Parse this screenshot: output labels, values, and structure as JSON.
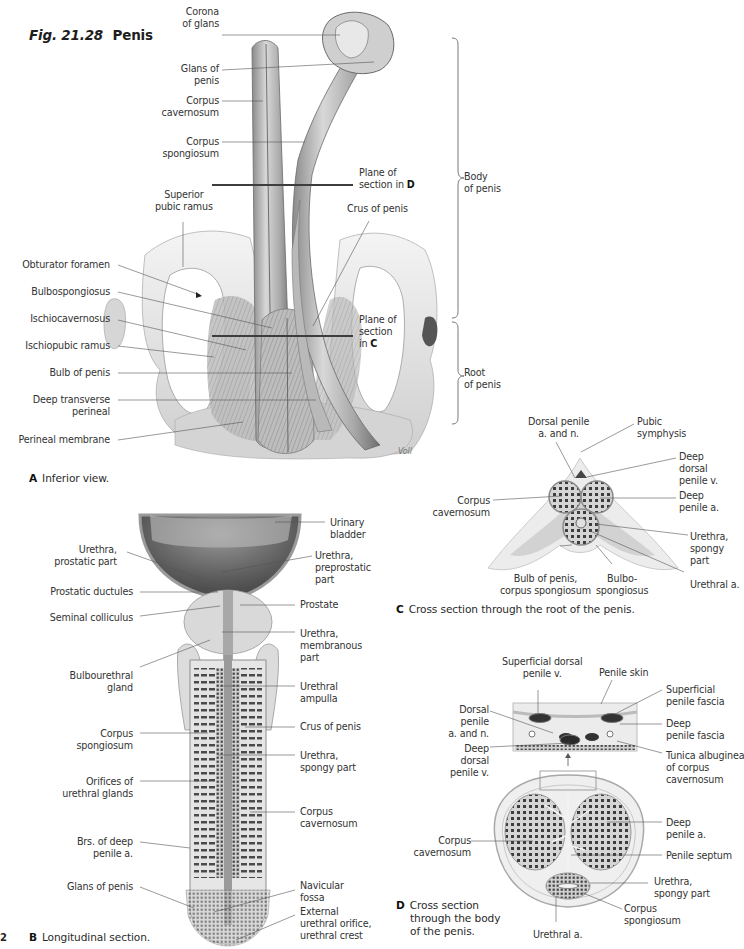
{
  "figure": {
    "number": "Fig. 21.28",
    "title": "Penis",
    "page_number": "2"
  },
  "panel_a": {
    "letter": "A",
    "caption": "Inferior view.",
    "labels": {
      "corona_of_glans": [
        "Corona",
        "of glans"
      ],
      "glans_of_penis": [
        "Glans of",
        "penis"
      ],
      "corpus_cavernosum": [
        "Corpus",
        "cavernosum"
      ],
      "corpus_spongiosum": [
        "Corpus",
        "spongiosum"
      ],
      "plane_of_section_d": [
        "Plane of",
        "section in",
        "D"
      ],
      "superior_pubic_ramus": [
        "Superior",
        "pubic ramus"
      ],
      "crus_of_penis": "Crus of penis",
      "obturator_foramen": "Obturator foramen",
      "bulbospongiosus": "Bulbospongiosus",
      "ischiocavernosus": "Ischiocavernosus",
      "ischiopubic_ramus": "Ischiopubic ramus",
      "bulb_of_penis": "Bulb of penis",
      "deep_transverse_perineal": [
        "Deep transverse",
        "perineal"
      ],
      "perineal_membrane": "Perineal membrane",
      "plane_of_section_c": [
        "Plane of",
        "section",
        "in",
        "C"
      ],
      "body_of_penis": [
        "Body",
        "of penis"
      ],
      "root_of_penis": [
        "Root",
        "of penis"
      ]
    },
    "signature": "Voll"
  },
  "panel_b": {
    "letter": "B",
    "caption": "Longitudinal section.",
    "labels": {
      "urinary_bladder": [
        "Urinary",
        "bladder"
      ],
      "urethra_prostatic_part": [
        "Urethra,",
        "prostatic part"
      ],
      "urethra_preprostatic_part": [
        "Urethra,",
        "preprostatic",
        "part"
      ],
      "prostatic_ductules": "Prostatic ductules",
      "prostate": "Prostate",
      "seminal_colliculus": "Seminal colliculus",
      "urethra_membranous_part": [
        "Urethra,",
        "membranous",
        "part"
      ],
      "bulbourethral_gland": [
        "Bulbourethral",
        "gland"
      ],
      "urethral_ampulla": [
        "Urethral",
        "ampulla"
      ],
      "corpus_spongiosum": [
        "Corpus",
        "spongiosum"
      ],
      "crus_of_penis": "Crus of penis",
      "urethra_spongy_part": [
        "Urethra,",
        "spongy part"
      ],
      "orifices_of_urethral_glands": [
        "Orifices of",
        "urethral glands"
      ],
      "corpus_cavernosum": [
        "Corpus",
        "cavernosum"
      ],
      "brs_of_deep_penile_a": [
        "Brs. of deep",
        "penile a."
      ],
      "glans_of_penis": "Glans of penis",
      "navicular_fossa": [
        "Navicular",
        "fossa"
      ],
      "external_urethral_orifice": [
        "External",
        "urethral orifice,",
        "urethral crest"
      ]
    }
  },
  "panel_c": {
    "letter": "C",
    "caption": "Cross section through the root of the penis.",
    "labels": {
      "dorsal_penile_a_and_n": [
        "Dorsal penile",
        "a. and n."
      ],
      "pubic_symphysis": [
        "Pubic",
        "symphysis"
      ],
      "deep_dorsal_penile_v": [
        "Deep",
        "dorsal",
        "penile v."
      ],
      "corpus_cavernosum": [
        "Corpus",
        "cavernosum"
      ],
      "deep_penile_a": [
        "Deep",
        "penile a."
      ],
      "urethra_spongy_part": [
        "Urethra,",
        "spongy",
        "part"
      ],
      "bulb_of_penis_corpus_spongiosum": [
        "Bulb of penis,",
        "corpus spongiosum"
      ],
      "bulbospongiosus": [
        "Bulbo-",
        "spongiosus"
      ],
      "urethral_a": "Urethral a."
    }
  },
  "panel_d": {
    "letter": "D",
    "caption": [
      "Cross section",
      "through the body",
      "of the penis."
    ],
    "labels": {
      "superficial_dorsal_penile_v": [
        "Superficial dorsal",
        "penile v."
      ],
      "penile_skin": "Penile skin",
      "superficial_penile_fascia": [
        "Superficial",
        "penile fascia"
      ],
      "dorsal_penile_a_and_n": [
        "Dorsal",
        "penile",
        "a. and n."
      ],
      "deep_penile_fascia": [
        "Deep",
        "penile fascia"
      ],
      "deep_dorsal_penile_v": [
        "Deep",
        "dorsal",
        "penile v."
      ],
      "tunica_albuginea": [
        "Tunica albuginea",
        "of corpus",
        "cavernosum"
      ],
      "corpus_cavernosum": [
        "Corpus",
        "cavernosum"
      ],
      "deep_penile_a": [
        "Deep",
        "penile a."
      ],
      "penile_septum": "Penile septum",
      "urethra_spongy_part": [
        "Urethra,",
        "spongy part"
      ],
      "corpus_spongiosum": [
        "Corpus",
        "spongiosum"
      ],
      "urethral_a": "Urethral a."
    }
  },
  "colors": {
    "background": "#ffffff",
    "label_text": "#333333",
    "leader_line": "#555555",
    "section_plane": "#444444",
    "tissue_light": "#e6e6e6",
    "tissue_mid": "#b8b8b8",
    "tissue_dark": "#5a5a5a"
  }
}
